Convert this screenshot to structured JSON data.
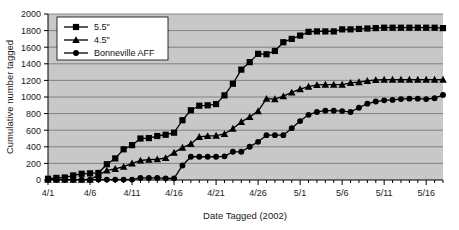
{
  "chart_data": {
    "type": "line",
    "title": "",
    "xlabel": "Date Tagged (2002)",
    "ylabel": "Cumulative number tagged",
    "ylim": [
      0,
      2000
    ],
    "ytick_labels": [
      "0",
      "200",
      "400",
      "600",
      "800",
      "1000",
      "1200",
      "1400",
      "1600",
      "1800",
      "2000"
    ],
    "ytick_values": [
      0,
      200,
      400,
      600,
      800,
      1000,
      1200,
      1400,
      1600,
      1800,
      2000
    ],
    "xtick_labels": [
      "4/1",
      "4/6",
      "4/11",
      "4/16",
      "4/21",
      "4/26",
      "5/1",
      "5/6",
      "5/11",
      "5/16"
    ],
    "xtick_values": [
      0,
      5,
      10,
      15,
      20,
      25,
      30,
      35,
      40,
      45
    ],
    "x": [
      0,
      1,
      2,
      3,
      4,
      5,
      6,
      7,
      8,
      9,
      10,
      11,
      12,
      13,
      14,
      15,
      16,
      17,
      18,
      19,
      20,
      21,
      22,
      23,
      24,
      25,
      26,
      27,
      28,
      29,
      30,
      31,
      32,
      33,
      34,
      35,
      36,
      37,
      38,
      39,
      40,
      41,
      42,
      43,
      44,
      45,
      46,
      47
    ],
    "x_dates": [
      "4/1",
      "4/2",
      "4/3",
      "4/4",
      "4/5",
      "4/6",
      "4/7",
      "4/8",
      "4/9",
      "4/10",
      "4/11",
      "4/12",
      "4/13",
      "4/14",
      "4/15",
      "4/16",
      "4/17",
      "4/18",
      "4/19",
      "4/20",
      "4/21",
      "4/22",
      "4/23",
      "4/24",
      "4/25",
      "4/26",
      "4/27",
      "4/28",
      "4/29",
      "4/30",
      "5/1",
      "5/2",
      "5/3",
      "5/4",
      "5/5",
      "5/6",
      "5/7",
      "5/8",
      "5/9",
      "5/10",
      "5/11",
      "5/12",
      "5/13",
      "5/14",
      "5/15",
      "5/16",
      "5/17",
      "5/18"
    ],
    "grid": true,
    "grid_axis": "y",
    "legend_position": "upper-left",
    "plot_bgcolor": "#c8c8c8",
    "series": [
      {
        "name": "5.5\"",
        "marker": "square",
        "color": "#000000",
        "values": [
          15,
          25,
          30,
          55,
          75,
          80,
          85,
          190,
          260,
          370,
          420,
          500,
          505,
          530,
          545,
          570,
          720,
          840,
          895,
          900,
          915,
          1020,
          1160,
          1330,
          1420,
          1520,
          1515,
          1555,
          1660,
          1700,
          1740,
          1785,
          1790,
          1790,
          1790,
          1815,
          1815,
          1820,
          1825,
          1830,
          1835,
          1835,
          1835,
          1835,
          1835,
          1835,
          1835,
          1830
        ]
      },
      {
        "name": "4.5\"",
        "marker": "triangle",
        "color": "#000000",
        "values": [
          5,
          5,
          5,
          5,
          5,
          5,
          60,
          115,
          135,
          160,
          200,
          235,
          245,
          250,
          265,
          330,
          390,
          435,
          520,
          530,
          535,
          555,
          620,
          700,
          760,
          830,
          980,
          975,
          1010,
          1055,
          1095,
          1125,
          1145,
          1150,
          1150,
          1150,
          1170,
          1180,
          1195,
          1205,
          1210,
          1210,
          1210,
          1210,
          1210,
          1210,
          1210,
          1210
        ]
      },
      {
        "name": "Bonneville AFF",
        "marker": "circle",
        "color": "#000000",
        "values": [
          5,
          5,
          5,
          5,
          5,
          5,
          5,
          5,
          5,
          5,
          5,
          25,
          25,
          25,
          20,
          20,
          175,
          280,
          280,
          280,
          280,
          285,
          340,
          340,
          400,
          460,
          540,
          540,
          540,
          625,
          710,
          785,
          820,
          835,
          835,
          830,
          820,
          870,
          920,
          945,
          960,
          965,
          975,
          980,
          980,
          975,
          985,
          1025
        ]
      }
    ]
  },
  "legend": {
    "entries": [
      {
        "label": "5.5\"",
        "marker": "square"
      },
      {
        "label": "4.5\"",
        "marker": "triangle"
      },
      {
        "label": "Bonneville AFF",
        "marker": "circle"
      }
    ]
  }
}
